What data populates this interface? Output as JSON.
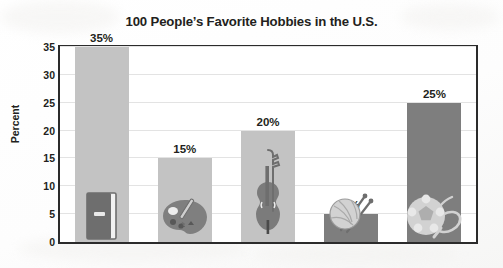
{
  "chart_data": {
    "type": "bar",
    "title": "100 People’s Favorite Hobbies in the U.S.",
    "xlabel": "",
    "ylabel": "Percent",
    "ylim": [
      0,
      35
    ],
    "ytick_step": 5,
    "grid": true,
    "legend": "none",
    "categories": [
      "Reading",
      "Painting",
      "Music",
      "Knitting",
      "Sports"
    ],
    "values": [
      35,
      15,
      20,
      5,
      25
    ],
    "value_labels": [
      "35%",
      "15%",
      "20%",
      "5%",
      "25%"
    ],
    "ytick_labels": [
      "0",
      "5",
      "10",
      "15",
      "20",
      "25",
      "30",
      "35"
    ],
    "bar_icons": [
      "book-icon",
      "paint-palette-icon",
      "violin-icon",
      "yarn-ball-icon",
      "sports-ball-icon"
    ],
    "bar_colors": [
      "#c3c3c3",
      "#c3c3c3",
      "#c3c3c3",
      "#7e7e7e",
      "#7e7e7e"
    ]
  },
  "colors": {
    "bar_light": "#c3c3c3",
    "bar_dark": "#7e7e7e",
    "icon_dark": "#6e6e6e",
    "icon_light": "#d2d2d2",
    "text": "#231f20",
    "frame": "#2b2b2b",
    "grid": "#e3e3e3",
    "plot_bg": "#ffffff",
    "page_bg": "#ffffff"
  }
}
